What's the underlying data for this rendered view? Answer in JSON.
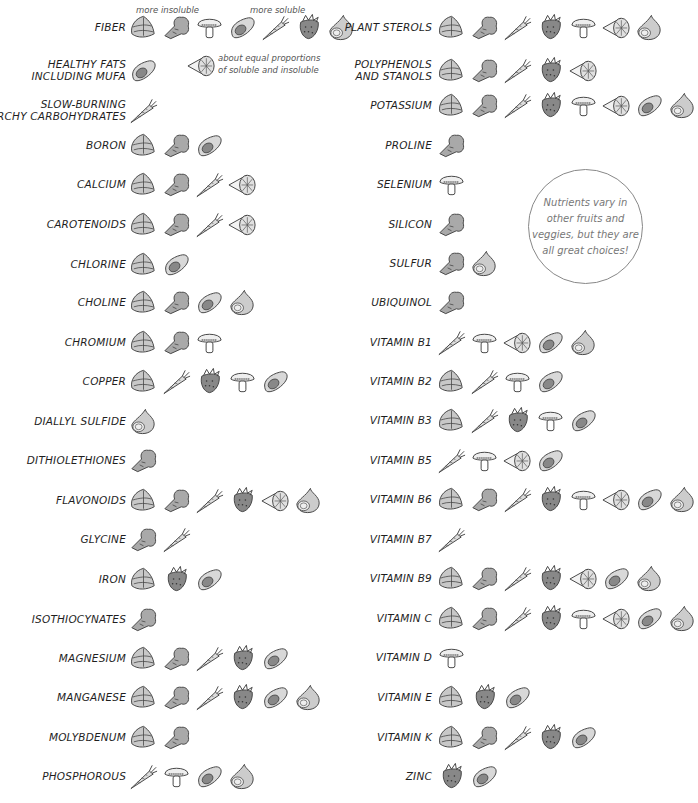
{
  "legend": {
    "more_insoluble": "more insoluble",
    "more_soluble": "more soluble",
    "equal_note_line1": "about equal proportions",
    "equal_note_line2": "of soluble and insoluble"
  },
  "bubble": {
    "text": "Nutrients vary in other fruits and veggies, but they are all great choices!"
  },
  "icon_types": {
    "greens": "leafy-greens-icon",
    "broccoli": "broccoli-icon",
    "mushroom": "mushroom-icon",
    "avocado": "avocado-icon",
    "carrot": "carrot-icon",
    "strawberry": "strawberry-icon",
    "onion": "onion-icon",
    "citrus": "citrus-icon"
  },
  "left_column": [
    {
      "label": "FIBER",
      "label2": "",
      "y": 27,
      "icons": [
        "greens",
        "broccoli",
        "mushroom",
        "avocado",
        "carrot",
        "strawberry",
        "onion"
      ]
    },
    {
      "label": "HEALTHY FATS",
      "label2": "INCLUDING MUFA",
      "y": 70,
      "icons": [
        "avocado"
      ]
    },
    {
      "label": "SLOW-BURNING",
      "label2": "STARCHY CARBOHYDRATES",
      "y": 110,
      "icons": [
        "carrot"
      ]
    },
    {
      "label": "BORON",
      "label2": "",
      "y": 145,
      "icons": [
        "greens",
        "broccoli",
        "avocado"
      ]
    },
    {
      "label": "CALCIUM",
      "label2": "",
      "y": 184,
      "icons": [
        "greens",
        "broccoli",
        "carrot",
        "citrus"
      ]
    },
    {
      "label": "CAROTENOIDS",
      "label2": "",
      "y": 224,
      "icons": [
        "greens",
        "broccoli",
        "carrot",
        "citrus"
      ]
    },
    {
      "label": "CHLORINE",
      "label2": "",
      "y": 264,
      "icons": [
        "greens",
        "avocado"
      ]
    },
    {
      "label": "CHOLINE",
      "label2": "",
      "y": 302,
      "icons": [
        "greens",
        "broccoli",
        "avocado",
        "onion"
      ]
    },
    {
      "label": "CHROMIUM",
      "label2": "",
      "y": 342,
      "icons": [
        "greens",
        "broccoli",
        "mushroom"
      ]
    },
    {
      "label": "COPPER",
      "label2": "",
      "y": 381,
      "icons": [
        "greens",
        "carrot",
        "strawberry",
        "mushroom",
        "avocado"
      ]
    },
    {
      "label": "DIALLYL SULFIDE",
      "label2": "",
      "y": 421,
      "icons": [
        "onion"
      ]
    },
    {
      "label": "DITHIOLETHIONES",
      "label2": "",
      "y": 460,
      "icons": [
        "broccoli"
      ]
    },
    {
      "label": "FLAVONOIDS",
      "label2": "",
      "y": 500,
      "icons": [
        "greens",
        "broccoli",
        "carrot",
        "strawberry",
        "citrus",
        "onion"
      ]
    },
    {
      "label": "GLYCINE",
      "label2": "",
      "y": 539,
      "icons": [
        "broccoli",
        "carrot"
      ]
    },
    {
      "label": "IRON",
      "label2": "",
      "y": 579,
      "icons": [
        "greens",
        "strawberry",
        "avocado"
      ]
    },
    {
      "label": "ISOTHIOCYNATES",
      "label2": "",
      "y": 619,
      "icons": [
        "broccoli"
      ]
    },
    {
      "label": "MAGNESIUM",
      "label2": "",
      "y": 658,
      "icons": [
        "greens",
        "broccoli",
        "carrot",
        "strawberry",
        "avocado"
      ]
    },
    {
      "label": "MANGANESE",
      "label2": "",
      "y": 697,
      "icons": [
        "greens",
        "broccoli",
        "carrot",
        "strawberry",
        "avocado",
        "onion"
      ]
    },
    {
      "label": "MOLYBDENUM",
      "label2": "",
      "y": 737,
      "icons": [
        "greens",
        "broccoli"
      ]
    },
    {
      "label": "PHOSPHOROUS",
      "label2": "",
      "y": 776,
      "icons": [
        "carrot",
        "mushroom",
        "avocado",
        "onion"
      ]
    }
  ],
  "right_column": [
    {
      "label": "PLANT STEROLS",
      "label2": "",
      "y": 27,
      "icons": [
        "greens",
        "broccoli",
        "carrot",
        "strawberry",
        "mushroom",
        "citrus",
        "onion"
      ]
    },
    {
      "label": "POLYPHENOLS",
      "label2": "AND STANOLS",
      "y": 70,
      "icons": [
        "greens",
        "broccoli",
        "carrot",
        "strawberry",
        "citrus"
      ]
    },
    {
      "label": "POTASSIUM",
      "label2": "",
      "y": 105,
      "icons": [
        "greens",
        "broccoli",
        "carrot",
        "strawberry",
        "mushroom",
        "citrus",
        "avocado",
        "onion"
      ]
    },
    {
      "label": "PROLINE",
      "label2": "",
      "y": 145,
      "icons": [
        "broccoli"
      ]
    },
    {
      "label": "SELENIUM",
      "label2": "",
      "y": 184,
      "icons": [
        "mushroom"
      ]
    },
    {
      "label": "SILICON",
      "label2": "",
      "y": 224,
      "icons": [
        "broccoli"
      ]
    },
    {
      "label": "SULFUR",
      "label2": "",
      "y": 263,
      "icons": [
        "broccoli",
        "onion"
      ]
    },
    {
      "label": "UBIQUINOL",
      "label2": "",
      "y": 302,
      "icons": [
        "broccoli"
      ]
    },
    {
      "label": "VITAMIN B1",
      "label2": "",
      "y": 342,
      "icons": [
        "carrot",
        "mushroom",
        "citrus",
        "avocado",
        "onion"
      ]
    },
    {
      "label": "VITAMIN B2",
      "label2": "",
      "y": 381,
      "icons": [
        "greens",
        "carrot",
        "mushroom",
        "avocado"
      ]
    },
    {
      "label": "VITAMIN B3",
      "label2": "",
      "y": 420,
      "icons": [
        "greens",
        "carrot",
        "strawberry",
        "mushroom",
        "avocado"
      ]
    },
    {
      "label": "VITAMIN B5",
      "label2": "",
      "y": 460,
      "icons": [
        "carrot",
        "mushroom",
        "citrus",
        "avocado"
      ]
    },
    {
      "label": "VITAMIN B6",
      "label2": "",
      "y": 499,
      "icons": [
        "greens",
        "broccoli",
        "carrot",
        "strawberry",
        "mushroom",
        "citrus",
        "avocado",
        "onion"
      ]
    },
    {
      "label": "VITAMIN B7",
      "label2": "",
      "y": 539,
      "icons": [
        "carrot"
      ]
    },
    {
      "label": "VITAMIN B9",
      "label2": "",
      "y": 578,
      "icons": [
        "greens",
        "broccoli",
        "carrot",
        "strawberry",
        "citrus",
        "avocado",
        "onion"
      ]
    },
    {
      "label": "VITAMIN C",
      "label2": "",
      "y": 618,
      "icons": [
        "greens",
        "broccoli",
        "carrot",
        "strawberry",
        "mushroom",
        "citrus",
        "avocado",
        "onion"
      ]
    },
    {
      "label": "VITAMIN D",
      "label2": "",
      "y": 657,
      "icons": [
        "mushroom"
      ]
    },
    {
      "label": "VITAMIN E",
      "label2": "",
      "y": 697,
      "icons": [
        "greens",
        "strawberry",
        "avocado"
      ]
    },
    {
      "label": "VITAMIN K",
      "label2": "",
      "y": 737,
      "icons": [
        "greens",
        "broccoli",
        "carrot",
        "strawberry",
        "avocado"
      ]
    },
    {
      "label": "ZINC",
      "label2": "",
      "y": 776,
      "icons": [
        "strawberry",
        "avocado"
      ]
    }
  ]
}
